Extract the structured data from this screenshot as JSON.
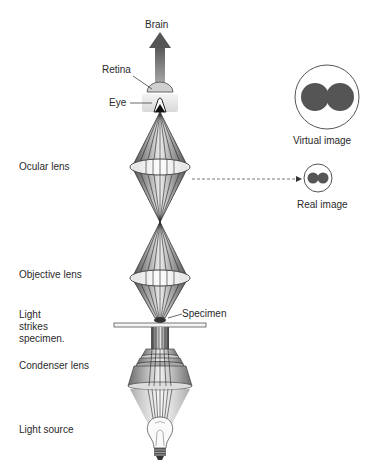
{
  "labels": {
    "brain": "Brain",
    "retina": "Retina",
    "eye": "Eye",
    "ocular_lens": "Ocular lens",
    "objective_lens": "Objective lens",
    "light_strikes": "Light\nstrikes\nspecimen.",
    "specimen": "Specimen",
    "condenser_lens": "Condenser lens",
    "light_source": "Light source",
    "virtual_image": "Virtual image",
    "real_image": "Real image"
  },
  "colors": {
    "cone_dark": "#5a5a5a",
    "cone_mid": "#9a9a9a",
    "cone_light": "#e4e4e4",
    "image_dot": "#555555",
    "text": "#2a2a2a"
  }
}
